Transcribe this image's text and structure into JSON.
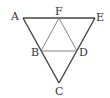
{
  "diagram": {
    "type": "geometry",
    "points": {
      "A": {
        "label": "A",
        "x": 23,
        "y": 18
      },
      "F": {
        "label": "F",
        "x": 59,
        "y": 18
      },
      "E": {
        "label": "E",
        "x": 95,
        "y": 18
      },
      "B": {
        "label": "B",
        "x": 41,
        "y": 51
      },
      "D": {
        "label": "D",
        "x": 77,
        "y": 51
      },
      "C": {
        "label": "C",
        "x": 59,
        "y": 83
      }
    },
    "segments": [
      [
        "A",
        "E"
      ],
      [
        "A",
        "C"
      ],
      [
        "E",
        "C"
      ],
      [
        "F",
        "B"
      ],
      [
        "F",
        "D"
      ],
      [
        "B",
        "D"
      ]
    ],
    "colors": {
      "outer_stroke": "#444444",
      "inner_stroke": "#777777",
      "label": "#333333"
    }
  }
}
